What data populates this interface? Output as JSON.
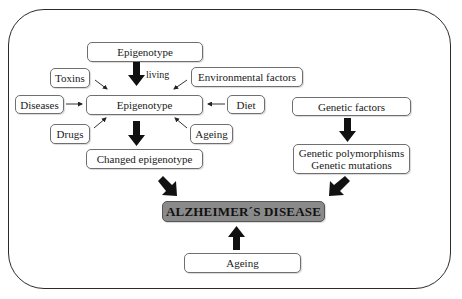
{
  "diagram": {
    "top_epigenotype": "Epigenotype",
    "living_label": "living",
    "center_epigenotype": "Epigenotype",
    "toxins": "Toxins",
    "environmental_factors": "Environmental factors",
    "diseases": "Diseases",
    "diet": "Diet",
    "drugs": "Drugs",
    "ageing_side": "Ageing",
    "changed_epigenotype": "Changed epigenotype",
    "genetic_factors": "Genetic factors",
    "genetic_polymorphisms": "Genetic polymorphisms",
    "genetic_mutations": "Genetic mutations",
    "alzheimers_disease": "ALZHEIMER´S DISEASE",
    "ageing_bottom": "Ageing"
  },
  "colors": {
    "disease_box": "#8a8a8a",
    "arrow": "#111111",
    "border": "#2b2b2b"
  }
}
